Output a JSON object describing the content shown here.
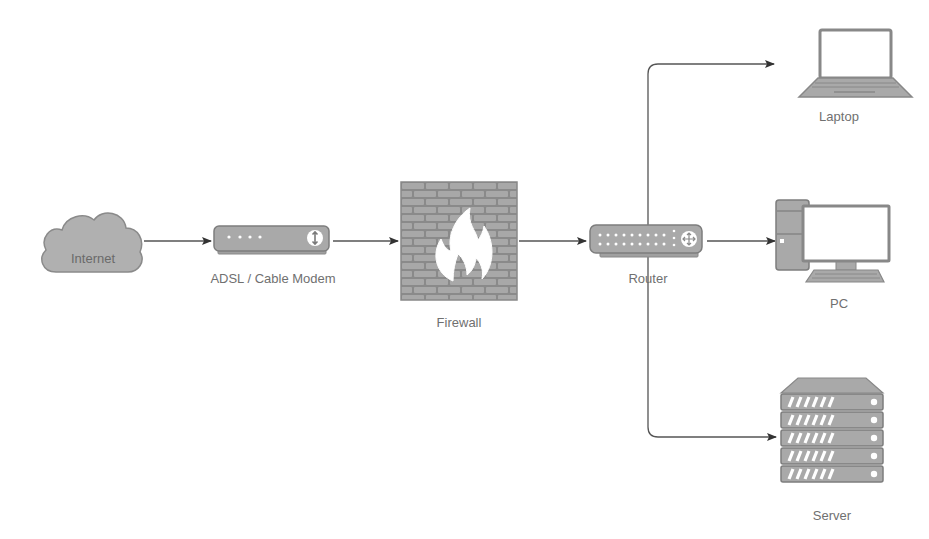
{
  "diagram": {
    "colors": {
      "device_fill": "#a9a9a9",
      "device_stroke": "#7a7a7a",
      "line": "#555555",
      "label": "#707070",
      "screen": "#ffffff"
    },
    "nodes": [
      {
        "id": "internet",
        "label": "Internet",
        "icon": "cloud-icon"
      },
      {
        "id": "modem",
        "label": "ADSL / Cable Modem",
        "icon": "modem-icon"
      },
      {
        "id": "firewall",
        "label": "Firewall",
        "icon": "firewall-icon"
      },
      {
        "id": "router",
        "label": "Router",
        "icon": "router-icon"
      },
      {
        "id": "laptop",
        "label": "Laptop",
        "icon": "laptop-icon"
      },
      {
        "id": "pc",
        "label": "PC",
        "icon": "desktop-pc-icon"
      },
      {
        "id": "server",
        "label": "Server",
        "icon": "server-icon"
      }
    ],
    "edges": [
      {
        "from": "Internet",
        "to": "ADSL / Cable Modem"
      },
      {
        "from": "ADSL / Cable Modem",
        "to": "Firewall"
      },
      {
        "from": "Firewall",
        "to": "Router"
      },
      {
        "from": "Router",
        "to": "Laptop"
      },
      {
        "from": "Router",
        "to": "PC"
      },
      {
        "from": "Router",
        "to": "Server"
      }
    ]
  }
}
